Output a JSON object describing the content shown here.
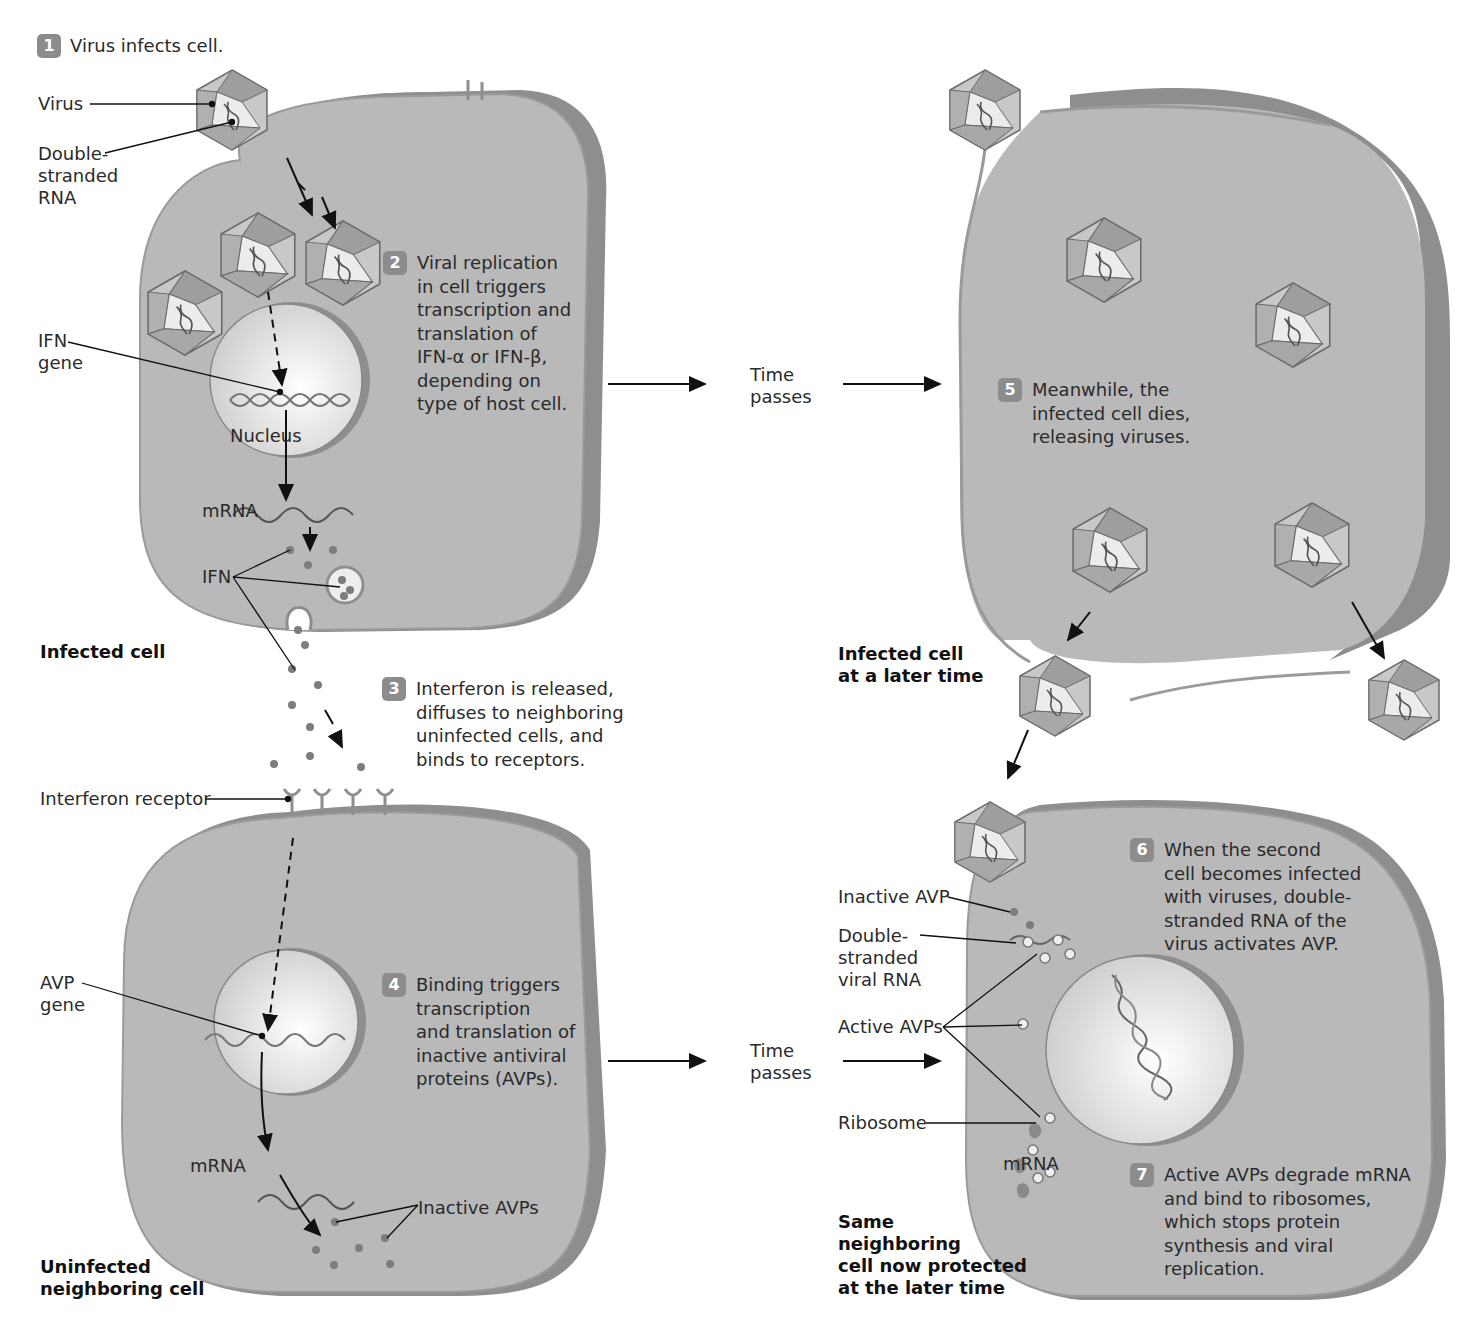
{
  "colors": {
    "cell_fill": "#b9b9b9",
    "cell_edge": "#8e8e8e",
    "nucleus_fill": "#e6e6e6",
    "badge": "#8c8c8c",
    "molecule": "#7d7d7d",
    "text": "#2a2a2a"
  },
  "steps": [
    {
      "number": "1",
      "lines": [
        "Virus infects cell."
      ]
    },
    {
      "number": "2",
      "lines": [
        "Viral replication",
        "in cell triggers",
        "transcription and",
        "translation of",
        "IFN-α or IFN-β,",
        "depending on",
        "type of host cell."
      ]
    },
    {
      "number": "3",
      "lines": [
        "Interferon is released,",
        "diffuses to neighboring",
        "uninfected cells, and",
        "binds to receptors."
      ]
    },
    {
      "number": "4",
      "lines": [
        "Binding triggers",
        "transcription",
        "and translation of",
        "inactive antiviral",
        "proteins (AVPs)."
      ]
    },
    {
      "number": "5",
      "lines": [
        "Meanwhile, the",
        "infected cell dies,",
        "releasing viruses."
      ]
    },
    {
      "number": "6",
      "lines": [
        "When the second",
        "cell becomes infected",
        "with viruses, double-",
        "stranded RNA of the",
        "virus activates AVP."
      ]
    },
    {
      "number": "7",
      "lines": [
        "Active AVPs degrade mRNA",
        "and bind to ribosomes,",
        "which stops protein",
        "synthesis and viral",
        "replication."
      ]
    }
  ],
  "labels": {
    "virus": "Virus",
    "dsrna": [
      "Double-",
      "stranded",
      "RNA"
    ],
    "ifn_gene": [
      "IFN",
      "gene"
    ],
    "nucleus": "Nucleus",
    "mrna": "mRNA",
    "ifn": "IFN",
    "interferon_receptor": "Interferon receptor",
    "avp_gene": [
      "AVP",
      "gene"
    ],
    "inactive_avps": "Inactive AVPs",
    "time_passes": [
      "Time",
      "passes"
    ],
    "inactive_avp": "Inactive AVP",
    "ds_viral_rna": [
      "Double-",
      "stranded",
      "viral RNA"
    ],
    "active_avps": "Active AVPs",
    "ribosome": "Ribosome",
    "mrna_right": "mRNA"
  },
  "captions": {
    "infected_cell": "Infected cell",
    "infected_later": [
      "Infected cell",
      "at a later time"
    ],
    "uninfected": [
      "Uninfected",
      "neighboring cell"
    ],
    "protected": [
      "Same",
      "neighboring",
      "cell now protected",
      "at the later time"
    ]
  }
}
